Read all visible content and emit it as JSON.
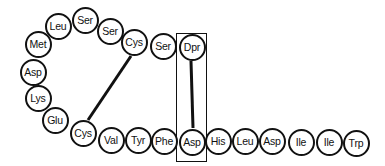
{
  "diagram": {
    "residues": [
      {
        "label": "Met",
        "x": 38,
        "y": 44
      },
      {
        "label": "Leu",
        "x": 58,
        "y": 26
      },
      {
        "label": "Ser",
        "x": 85,
        "y": 20
      },
      {
        "label": "Ser",
        "x": 110,
        "y": 31
      },
      {
        "label": "Cys",
        "x": 134,
        "y": 42
      },
      {
        "label": "Ser",
        "x": 163,
        "y": 46
      },
      {
        "label": "Dpr",
        "x": 192,
        "y": 47
      },
      {
        "label": "Asp",
        "x": 33,
        "y": 72
      },
      {
        "label": "Lys",
        "x": 38,
        "y": 98
      },
      {
        "label": "Glu",
        "x": 55,
        "y": 120
      },
      {
        "label": "Cys",
        "x": 83,
        "y": 133
      },
      {
        "label": "Val",
        "x": 111,
        "y": 140
      },
      {
        "label": "Tyr",
        "x": 138,
        "y": 140
      },
      {
        "label": "Phe",
        "x": 164,
        "y": 141
      },
      {
        "label": "Asp",
        "x": 192,
        "y": 142
      },
      {
        "label": "His",
        "x": 218,
        "y": 141
      },
      {
        "label": "Leu",
        "x": 245,
        "y": 141
      },
      {
        "label": "Asp",
        "x": 272,
        "y": 141
      },
      {
        "label": "Ile",
        "x": 301,
        "y": 142
      },
      {
        "label": "Ile",
        "x": 329,
        "y": 142
      },
      {
        "label": "Trp",
        "x": 356,
        "y": 143
      }
    ],
    "bonds": [
      {
        "from": "Cys (top)",
        "to": "Cys (bottom)",
        "x1": 131,
        "y1": 56,
        "x2": 88,
        "y2": 120
      },
      {
        "from": "Dpr",
        "to": "Asp",
        "x1": 191,
        "y1": 61,
        "x2": 193,
        "y2": 128
      }
    ],
    "highlight_box": {
      "x": 176,
      "y": 33,
      "w": 31,
      "h": 129
    }
  }
}
